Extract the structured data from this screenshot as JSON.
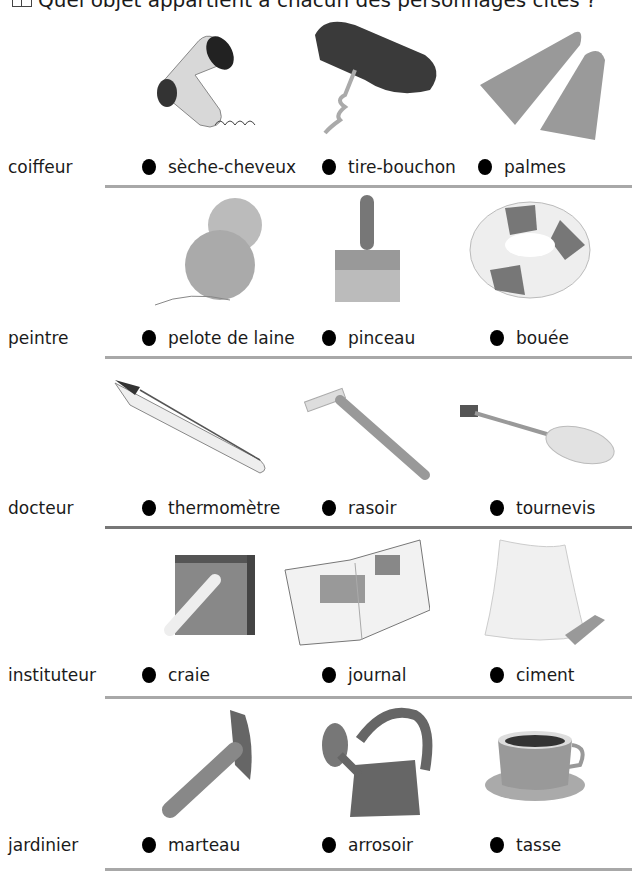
{
  "header": {
    "icon": "book-icon",
    "question": "Quel objet appartient à chacun des personnages cités ?"
  },
  "rows": [
    {
      "character": "coiffeur",
      "options": [
        {
          "label": "sèche-cheveux",
          "icon": "hair-dryer-icon"
        },
        {
          "label": "tire-bouchon",
          "icon": "corkscrew-icon"
        },
        {
          "label": "palmes",
          "icon": "flippers-icon"
        }
      ]
    },
    {
      "character": "peintre",
      "options": [
        {
          "label": "pelote de laine",
          "icon": "yarn-ball-icon"
        },
        {
          "label": "pinceau",
          "icon": "paintbrush-icon"
        },
        {
          "label": "bouée",
          "icon": "life-buoy-icon"
        }
      ]
    },
    {
      "character": "docteur",
      "options": [
        {
          "label": "thermomètre",
          "icon": "thermometer-icon"
        },
        {
          "label": "rasoir",
          "icon": "razor-icon"
        },
        {
          "label": "tournevis",
          "icon": "screwdriver-icon"
        }
      ]
    },
    {
      "character": "instituteur",
      "options": [
        {
          "label": "craie",
          "icon": "chalk-icon"
        },
        {
          "label": "journal",
          "icon": "newspaper-icon"
        },
        {
          "label": "ciment",
          "icon": "cement-bag-icon"
        }
      ]
    },
    {
      "character": "jardinier",
      "options": [
        {
          "label": "marteau",
          "icon": "hammer-icon"
        },
        {
          "label": "arrosoir",
          "icon": "watering-can-icon"
        },
        {
          "label": "tasse",
          "icon": "cup-icon"
        }
      ]
    }
  ],
  "colors": {
    "divider": "#a8a8a8",
    "bullet": "#000000",
    "text": "#1a1a1a"
  }
}
